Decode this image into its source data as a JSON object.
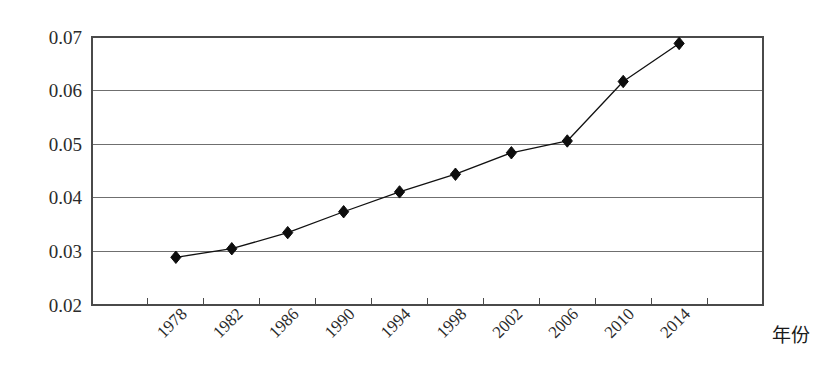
{
  "chart_data": {
    "type": "line",
    "title": "",
    "subtitle": "",
    "xlabel": "年份",
    "ylabel": "",
    "categories": [
      "1978",
      "1982",
      "1986",
      "1990",
      "1994",
      "1998",
      "2002",
      "2006",
      "2010",
      "2014"
    ],
    "values": [
      0.0289,
      0.0305,
      0.0335,
      0.0374,
      0.0411,
      0.0444,
      0.0484,
      0.0506,
      0.0617,
      0.0688
    ],
    "series": [
      {
        "name": "series-1",
        "values": [
          0.0289,
          0.0305,
          0.0335,
          0.0374,
          0.0411,
          0.0444,
          0.0484,
          0.0506,
          0.0617,
          0.0688
        ],
        "marker": "diamond",
        "color": "#0d0d0d"
      }
    ],
    "ylim": [
      0.02,
      0.07
    ],
    "yticks": [
      0.02,
      0.03,
      0.04,
      0.05,
      0.06,
      0.07
    ],
    "ytick_labels": [
      "0.02",
      "0.03",
      "0.04",
      "0.05",
      "0.06",
      "0.07"
    ],
    "xtick_labels": [
      "1978",
      "1982",
      "1986",
      "1990",
      "1994",
      "1998",
      "2002",
      "2006",
      "2010",
      "2014"
    ],
    "xtick_rotation": 45,
    "grid": "horizontal",
    "legend": "none",
    "colors": {
      "line": "#111111",
      "marker": "#0d0d0d",
      "grid": "#6f6f6f",
      "frame": "#4a4a4a",
      "background": "#ffffff"
    }
  },
  "labels": {
    "x_axis_title": "年份"
  }
}
